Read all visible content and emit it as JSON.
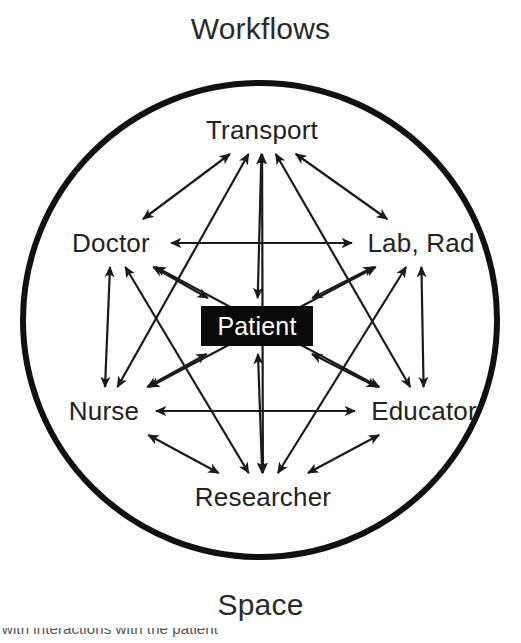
{
  "figure": {
    "type": "concept-diagram",
    "top_caption": "Workflows",
    "bottom_caption": "Space",
    "footer_caption_clipped": "with interactions with the patient",
    "boundary": {
      "shape": "circle",
      "stroke_color": "#111111",
      "stroke_width_px": 6,
      "center_x": 260,
      "center_y": 320,
      "radius": 237
    },
    "center_node": {
      "label": "Patient",
      "text_color": "#ffffff",
      "fill_color": "#0a0a0a",
      "shape": "rectangle",
      "x": 257,
      "y": 326
    },
    "outer_nodes": [
      {
        "id": "transport",
        "label": "Transport",
        "x": 262,
        "y": 130,
        "halfw": 74,
        "halfh": 17
      },
      {
        "id": "doctor",
        "label": "Doctor",
        "x": 111,
        "y": 243,
        "halfw": 53,
        "halfh": 17
      },
      {
        "id": "lab-rad",
        "label": "Lab, Rad",
        "x": 421,
        "y": 243,
        "halfw": 62,
        "halfh": 17
      },
      {
        "id": "nurse",
        "label": "Nurse",
        "x": 104,
        "y": 411,
        "halfw": 45,
        "halfh": 17
      },
      {
        "id": "educator",
        "label": "Educator",
        "x": 424,
        "y": 411,
        "halfw": 62,
        "halfh": 17
      },
      {
        "id": "researcher",
        "label": "Researcher",
        "x": 263,
        "y": 497,
        "halfw": 78,
        "halfh": 17
      }
    ],
    "edges": {
      "style": "double-headed-arrow",
      "stroke_color": "#1a1a1a",
      "stroke_width_px": 2.2,
      "description": "Every outer node is bidirectionally linked to every other outer node and to the central Patient node",
      "pairs": [
        [
          "transport",
          "doctor"
        ],
        [
          "transport",
          "lab-rad"
        ],
        [
          "transport",
          "nurse"
        ],
        [
          "transport",
          "educator"
        ],
        [
          "transport",
          "researcher"
        ],
        [
          "doctor",
          "lab-rad"
        ],
        [
          "doctor",
          "nurse"
        ],
        [
          "doctor",
          "educator"
        ],
        [
          "doctor",
          "researcher"
        ],
        [
          "lab-rad",
          "nurse"
        ],
        [
          "lab-rad",
          "educator"
        ],
        [
          "lab-rad",
          "researcher"
        ],
        [
          "nurse",
          "educator"
        ],
        [
          "nurse",
          "researcher"
        ],
        [
          "educator",
          "researcher"
        ],
        [
          "transport",
          "patient"
        ],
        [
          "doctor",
          "patient"
        ],
        [
          "lab-rad",
          "patient"
        ],
        [
          "nurse",
          "patient"
        ],
        [
          "educator",
          "patient"
        ],
        [
          "researcher",
          "patient"
        ]
      ]
    }
  }
}
